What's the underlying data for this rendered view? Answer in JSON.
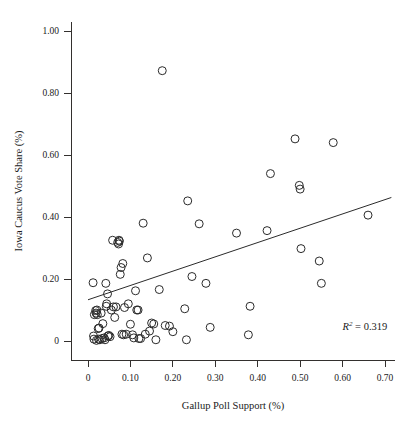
{
  "chart_data": {
    "type": "scatter",
    "title": "",
    "xlabel": "Gallup Poll Support (%)",
    "ylabel": "Iowa Caucus Vote Share (%)",
    "xlim": [
      -0.02,
      0.73
    ],
    "ylim": [
      -0.03,
      1.06
    ],
    "grid": false,
    "legend": null,
    "xticks": [
      0,
      0.1,
      0.2,
      0.3,
      0.4,
      0.5,
      0.6,
      0.7
    ],
    "xtick_labels": [
      "0",
      "0.10",
      "0.20",
      "0.30",
      "0.40",
      "0.50",
      "0.60",
      "0.70"
    ],
    "yticks": [
      0,
      0.2,
      0.4,
      0.6,
      0.8,
      1.0
    ],
    "ytick_labels": [
      "0",
      "0.20",
      "0.40",
      "0.60",
      "0.80",
      "1.00"
    ],
    "annotations": [
      {
        "text": "R2 = 0.319",
        "r_symbol": "R",
        "exponent": "2",
        "equals_value": "= 0.319",
        "x": 0.6,
        "y": 0.035
      }
    ],
    "marker": {
      "shape": "open-circle",
      "radius_px": 4,
      "stroke": "#2b2b2b",
      "fill": "none"
    },
    "trendline": {
      "type": "linear",
      "x0": 0.0,
      "y0": 0.133,
      "x1": 0.715,
      "y1": 0.463,
      "stroke": "#2b2b2b"
    },
    "series": [
      {
        "name": "candidates",
        "points": [
          [
            0.012,
            0.188
          ],
          [
            0.013,
            0.016
          ],
          [
            0.014,
            0.006
          ],
          [
            0.015,
            0.085
          ],
          [
            0.018,
            0.098
          ],
          [
            0.019,
            0.09
          ],
          [
            0.02,
            0.002
          ],
          [
            0.021,
            0.1
          ],
          [
            0.022,
            0.085
          ],
          [
            0.024,
            0.04
          ],
          [
            0.025,
            0.006
          ],
          [
            0.026,
            0.042
          ],
          [
            0.028,
            0.004
          ],
          [
            0.031,
            0.09
          ],
          [
            0.033,
            0.008
          ],
          [
            0.035,
            0.056
          ],
          [
            0.038,
            0.01
          ],
          [
            0.04,
            0.004
          ],
          [
            0.042,
            0.186
          ],
          [
            0.043,
            0.112
          ],
          [
            0.044,
            0.12
          ],
          [
            0.046,
            0.152
          ],
          [
            0.047,
            0.016
          ],
          [
            0.049,
            0.018
          ],
          [
            0.052,
            0.014
          ],
          [
            0.055,
            0.1
          ],
          [
            0.058,
            0.325
          ],
          [
            0.06,
            0.11
          ],
          [
            0.063,
            0.076
          ],
          [
            0.066,
            0.11
          ],
          [
            0.07,
            0.318
          ],
          [
            0.072,
            0.313
          ],
          [
            0.073,
            0.325
          ],
          [
            0.074,
            0.322
          ],
          [
            0.076,
            0.215
          ],
          [
            0.078,
            0.237
          ],
          [
            0.08,
            0.022
          ],
          [
            0.082,
            0.25
          ],
          [
            0.084,
            0.02
          ],
          [
            0.086,
            0.108
          ],
          [
            0.09,
            0.022
          ],
          [
            0.095,
            0.12
          ],
          [
            0.1,
            0.054
          ],
          [
            0.105,
            0.02
          ],
          [
            0.108,
            0.01
          ],
          [
            0.112,
            0.162
          ],
          [
            0.115,
            0.1
          ],
          [
            0.118,
            0.1
          ],
          [
            0.12,
            0.008
          ],
          [
            0.124,
            0.008
          ],
          [
            0.13,
            0.38
          ],
          [
            0.135,
            0.022
          ],
          [
            0.14,
            0.268
          ],
          [
            0.145,
            0.032
          ],
          [
            0.15,
            0.058
          ],
          [
            0.155,
            0.055
          ],
          [
            0.16,
            0.004
          ],
          [
            0.168,
            0.166
          ],
          [
            0.175,
            0.872
          ],
          [
            0.182,
            0.05
          ],
          [
            0.192,
            0.048
          ],
          [
            0.2,
            0.03
          ],
          [
            0.228,
            0.104
          ],
          [
            0.232,
            0.004
          ],
          [
            0.235,
            0.452
          ],
          [
            0.245,
            0.208
          ],
          [
            0.262,
            0.378
          ],
          [
            0.278,
            0.186
          ],
          [
            0.288,
            0.044
          ],
          [
            0.35,
            0.348
          ],
          [
            0.378,
            0.02
          ],
          [
            0.382,
            0.112
          ],
          [
            0.422,
            0.356
          ],
          [
            0.43,
            0.54
          ],
          [
            0.488,
            0.652
          ],
          [
            0.498,
            0.502
          ],
          [
            0.5,
            0.49
          ],
          [
            0.502,
            0.298
          ],
          [
            0.545,
            0.258
          ],
          [
            0.55,
            0.186
          ],
          [
            0.578,
            0.64
          ],
          [
            0.66,
            0.406
          ]
        ]
      }
    ]
  },
  "figure": {
    "axis_color": "#33302e",
    "point_color": "#2b2b2b",
    "background": "#ffffff"
  }
}
